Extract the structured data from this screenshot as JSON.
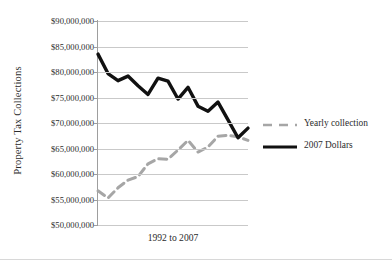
{
  "chart_data": {
    "type": "line",
    "title": "",
    "xlabel": "1992 to 2007",
    "ylabel": "Property Tax Collections",
    "ylim": [
      50000000,
      90000000
    ],
    "ytick_labels": [
      "$90,000,000",
      "$85,000,000",
      "$80,000,000",
      "$75,000,000",
      "$70,000,000",
      "$65,000,000",
      "$60,000,000",
      "$55,000,000",
      "$50,000,000"
    ],
    "ytick_values": [
      90000000,
      85000000,
      80000000,
      75000000,
      70000000,
      65000000,
      60000000,
      55000000,
      50000000
    ],
    "grid": true,
    "legend_position": "right",
    "x": [
      1992,
      1993,
      1994,
      1995,
      1996,
      1997,
      1998,
      1999,
      2000,
      2001,
      2002,
      2003,
      2004,
      2005,
      2006,
      2007
    ],
    "xtick_labels": [],
    "series": [
      {
        "name": "Yearly collection",
        "style": "dashed",
        "color": "#a6a6a6",
        "values": [
          56700000,
          55300000,
          57300000,
          58800000,
          59500000,
          62000000,
          63000000,
          62900000,
          64700000,
          66600000,
          64300000,
          65300000,
          67400000,
          67600000,
          67300000,
          66600000
        ]
      },
      {
        "name": "2007 Dollars",
        "style": "solid",
        "color": "#111111",
        "values": [
          83500000,
          79700000,
          78300000,
          79200000,
          77300000,
          75600000,
          78800000,
          78200000,
          74700000,
          77000000,
          73300000,
          72300000,
          74100000,
          70600000,
          67100000,
          69000000
        ]
      }
    ]
  },
  "legend": {
    "entries": [
      {
        "label": "Yearly collection"
      },
      {
        "label": "2007 Dollars"
      }
    ]
  },
  "colors": {
    "gray_series": "#a6a6a6",
    "black_series": "#111111",
    "gridline": "#c9c9c9",
    "axis": "#9e9e9e",
    "text": "#2b2b2b",
    "background": "#ffffff"
  }
}
